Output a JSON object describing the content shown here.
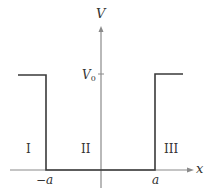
{
  "diagram": {
    "type": "finite square well potential",
    "axes": {
      "y_label": "V",
      "x_label": "x",
      "color": "#8a8a8a"
    },
    "potential": {
      "barrier_label": "V",
      "barrier_label_sub": "0",
      "line_color": "#3a3a3a"
    },
    "tick_labels": {
      "left_edge": "−a",
      "right_edge": "a"
    },
    "regions": [
      {
        "label": "I"
      },
      {
        "label": "II"
      },
      {
        "label": "III"
      }
    ]
  }
}
